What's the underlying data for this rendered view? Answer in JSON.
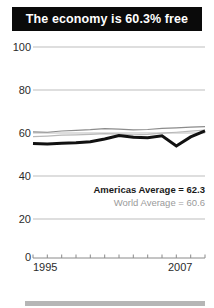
{
  "header": {
    "title": "The economy is 60.3% free"
  },
  "legend": {
    "americas": "Americas Average = 62.3",
    "world": "World Average = 60.6",
    "americas_color": "#1a1a1a",
    "world_color": "#9a9a9a"
  },
  "chart_data": {
    "type": "line",
    "title": "The economy is 60.3% free",
    "xlabel": "",
    "ylabel": "",
    "ylim": [
      0,
      100
    ],
    "yticks": [
      100,
      80,
      60,
      40,
      20,
      0
    ],
    "xlim": [
      1995,
      2007
    ],
    "xticks": [
      1995,
      1996,
      1997,
      1998,
      1999,
      2000,
      2001,
      2002,
      2003,
      2004,
      2005,
      2006,
      2007
    ],
    "xtick_labels_shown": [
      "1995",
      "2007"
    ],
    "grid": true,
    "legend_position": "inside-right",
    "x": [
      1995,
      1996,
      1997,
      1998,
      1999,
      2000,
      2001,
      2002,
      2003,
      2004,
      2005,
      2006,
      2007
    ],
    "series": [
      {
        "name": "Country score",
        "color": "#111111",
        "width": 3,
        "values": [
          54.3,
          54.0,
          54.4,
          54.6,
          55.1,
          56.4,
          58.0,
          57.2,
          57.0,
          57.9,
          53.1,
          57.4,
          60.3
        ]
      },
      {
        "name": "Americas Average",
        "color": "#8c8c8c",
        "width": 1.2,
        "values": [
          59.8,
          59.6,
          60.2,
          60.5,
          60.8,
          61.3,
          61.1,
          60.7,
          60.9,
          61.4,
          61.7,
          62.0,
          62.3
        ]
      },
      {
        "name": "World Average",
        "color": "#b9b9b9",
        "width": 1.2,
        "values": [
          57.5,
          57.8,
          58.2,
          58.4,
          58.6,
          58.9,
          58.7,
          58.4,
          58.6,
          59.2,
          59.6,
          60.1,
          60.6
        ]
      }
    ]
  }
}
